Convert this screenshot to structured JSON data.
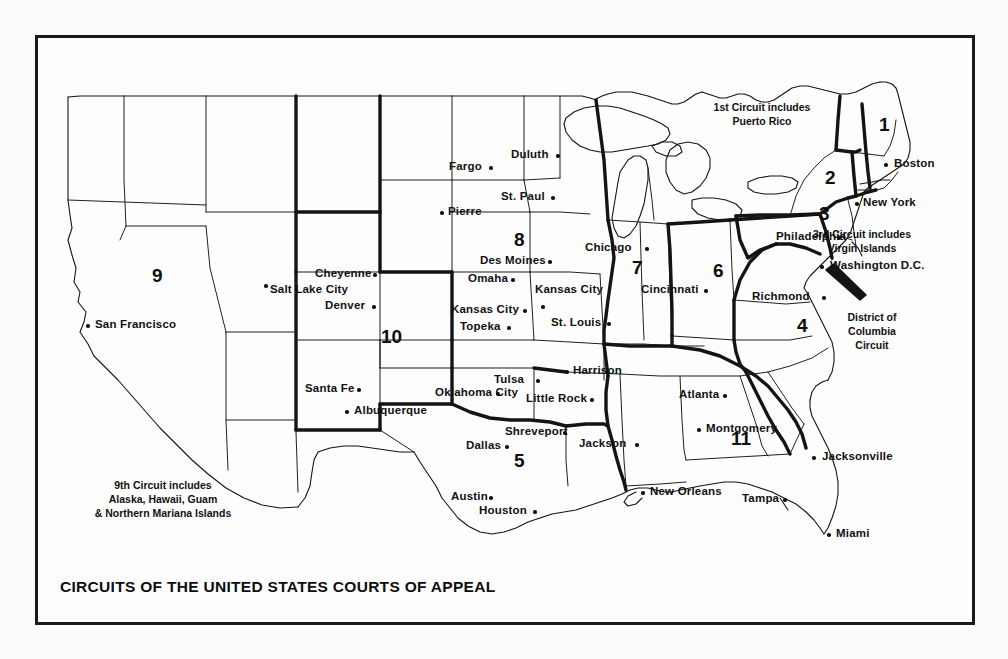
{
  "document": {
    "title": "CIRCUITS OF THE UNITED STATES COURTS OF APPEAL",
    "type": "map"
  },
  "annotations": [
    {
      "id": "note-1st",
      "text_lines": [
        "1st Circuit includes",
        "Puerto Rico"
      ],
      "x": 762,
      "y": 100
    },
    {
      "id": "note-3rd",
      "text_lines": [
        "3rd Circuit includes",
        "Virgin Islands"
      ],
      "x": 862,
      "y": 227
    },
    {
      "id": "note-dc",
      "text_lines": [
        "District of",
        "Columbia",
        "Circuit"
      ],
      "x": 872,
      "y": 310
    },
    {
      "id": "note-9th",
      "text_lines": [
        "9th Circuit includes",
        "Alaska, Hawaii, Guam",
        "& Northern Mariana Islands"
      ],
      "x": 163,
      "y": 478
    }
  ],
  "circuits": [
    {
      "number": "1",
      "x": 879,
      "y": 114
    },
    {
      "number": "2",
      "x": 825,
      "y": 167
    },
    {
      "number": "3",
      "x": 819,
      "y": 203
    },
    {
      "number": "4",
      "x": 797,
      "y": 315
    },
    {
      "number": "5",
      "x": 514,
      "y": 450
    },
    {
      "number": "6",
      "x": 713,
      "y": 260
    },
    {
      "number": "7",
      "x": 632,
      "y": 257
    },
    {
      "number": "8",
      "x": 514,
      "y": 229
    },
    {
      "number": "9",
      "x": 152,
      "y": 265
    },
    {
      "number": "10",
      "x": 381,
      "y": 326
    },
    {
      "number": "11",
      "x": 731,
      "y": 428
    }
  ],
  "cities": [
    {
      "name": "Boston",
      "label_x": 894,
      "label_y": 157,
      "dot_x": 884,
      "dot_y": 163,
      "align": "left"
    },
    {
      "name": "New York",
      "label_x": 863,
      "label_y": 196,
      "dot_x": 855,
      "dot_y": 202,
      "align": "left"
    },
    {
      "name": "Philadelphia",
      "label_x": 776,
      "label_y": 230,
      "dot_x": 837,
      "dot_y": 236,
      "align": "left"
    },
    {
      "name": "Washington D.C.",
      "label_x": 830,
      "label_y": 259,
      "dot_x": 820,
      "dot_y": 265,
      "align": "left"
    },
    {
      "name": "Richmond",
      "label_x": 752,
      "label_y": 290,
      "dot_x": 822,
      "dot_y": 296,
      "align": "left"
    },
    {
      "name": "Cincinnati",
      "label_x": 641,
      "label_y": 283,
      "dot_x": 704,
      "dot_y": 289,
      "align": "left"
    },
    {
      "name": "Chicago",
      "label_x": 585,
      "label_y": 241,
      "dot_x": 645,
      "dot_y": 247,
      "align": "left"
    },
    {
      "name": "Duluth",
      "label_x": 511,
      "label_y": 148,
      "dot_x": 556,
      "dot_y": 154,
      "align": "left"
    },
    {
      "name": "St. Paul",
      "label_x": 501,
      "label_y": 190,
      "dot_x": 551,
      "dot_y": 196,
      "align": "left"
    },
    {
      "name": "Fargo",
      "label_x": 449,
      "label_y": 160,
      "dot_x": 489,
      "dot_y": 166,
      "align": "left"
    },
    {
      "name": "Pierre",
      "label_x": 448,
      "label_y": 205,
      "dot_x": 440,
      "dot_y": 211,
      "align": "left"
    },
    {
      "name": "Des Moines",
      "label_x": 480,
      "label_y": 254,
      "dot_x": 548,
      "dot_y": 260,
      "align": "left"
    },
    {
      "name": "Omaha",
      "label_x": 468,
      "label_y": 272,
      "dot_x": 511,
      "dot_y": 278,
      "align": "left"
    },
    {
      "name": "Kansas City",
      "label_x": 535,
      "label_y": 283,
      "dot_x": 541,
      "dot_y": 305,
      "align": "left"
    },
    {
      "name": "Kansas City",
      "label_x": 451,
      "label_y": 303,
      "dot_x": 523,
      "dot_y": 309,
      "align": "left"
    },
    {
      "name": "Topeka",
      "label_x": 460,
      "label_y": 320,
      "dot_x": 507,
      "dot_y": 326,
      "align": "left"
    },
    {
      "name": "St. Louis",
      "label_x": 551,
      "label_y": 316,
      "dot_x": 607,
      "dot_y": 322,
      "align": "left"
    },
    {
      "name": "Harrison",
      "label_x": 573,
      "label_y": 364,
      "dot_x": 565,
      "dot_y": 370,
      "align": "left"
    },
    {
      "name": "Little Rock",
      "label_x": 526,
      "label_y": 392,
      "dot_x": 590,
      "dot_y": 398,
      "align": "left"
    },
    {
      "name": "Tulsa",
      "label_x": 494,
      "label_y": 373,
      "dot_x": 536,
      "dot_y": 379,
      "align": "left"
    },
    {
      "name": "Oklahoma City",
      "label_x": 435,
      "label_y": 386,
      "dot_x": 496,
      "dot_y": 392,
      "align": "left"
    },
    {
      "name": "Shreveport",
      "label_x": 505,
      "label_y": 425,
      "dot_x": 563,
      "dot_y": 431,
      "align": "left"
    },
    {
      "name": "Jackson",
      "label_x": 579,
      "label_y": 437,
      "dot_x": 635,
      "dot_y": 443,
      "align": "left"
    },
    {
      "name": "Dallas",
      "label_x": 466,
      "label_y": 439,
      "dot_x": 505,
      "dot_y": 445,
      "align": "left"
    },
    {
      "name": "Austin",
      "label_x": 451,
      "label_y": 490,
      "dot_x": 489,
      "dot_y": 496,
      "align": "left"
    },
    {
      "name": "Houston",
      "label_x": 479,
      "label_y": 504,
      "dot_x": 533,
      "dot_y": 510,
      "align": "left"
    },
    {
      "name": "New Orleans",
      "label_x": 650,
      "label_y": 485,
      "dot_x": 641,
      "dot_y": 491,
      "align": "left"
    },
    {
      "name": "Atlanta",
      "label_x": 679,
      "label_y": 388,
      "dot_x": 723,
      "dot_y": 394,
      "align": "left"
    },
    {
      "name": "Montgomery",
      "label_x": 706,
      "label_y": 422,
      "dot_x": 697,
      "dot_y": 428,
      "align": "left"
    },
    {
      "name": "Jacksonville",
      "label_x": 822,
      "label_y": 450,
      "dot_x": 812,
      "dot_y": 456,
      "align": "left"
    },
    {
      "name": "Tampa",
      "label_x": 742,
      "label_y": 492,
      "dot_x": 783,
      "dot_y": 498,
      "align": "left"
    },
    {
      "name": "Miami",
      "label_x": 836,
      "label_y": 527,
      "dot_x": 827,
      "dot_y": 533,
      "align": "left"
    },
    {
      "name": "Cheyenne",
      "label_x": 315,
      "label_y": 267,
      "dot_x": 373,
      "dot_y": 273,
      "align": "left"
    },
    {
      "name": "Denver",
      "label_x": 325,
      "label_y": 299,
      "dot_x": 372,
      "dot_y": 305,
      "align": "left"
    },
    {
      "name": "Salt Lake City",
      "label_x": 270,
      "label_y": 283,
      "dot_x": 264,
      "dot_y": 284,
      "align": "left"
    },
    {
      "name": "Santa Fe",
      "label_x": 305,
      "label_y": 382,
      "dot_x": 357,
      "dot_y": 388,
      "align": "left"
    },
    {
      "name": "Albuquerque",
      "label_x": 354,
      "label_y": 404,
      "dot_x": 345,
      "dot_y": 410,
      "align": "left"
    },
    {
      "name": "San Francisco",
      "label_x": 95,
      "label_y": 318,
      "dot_x": 86,
      "dot_y": 324,
      "align": "left"
    }
  ],
  "colors": {
    "ink": "#111111",
    "paper": "#fdfdfd",
    "page_background": "#fbfbfb"
  }
}
